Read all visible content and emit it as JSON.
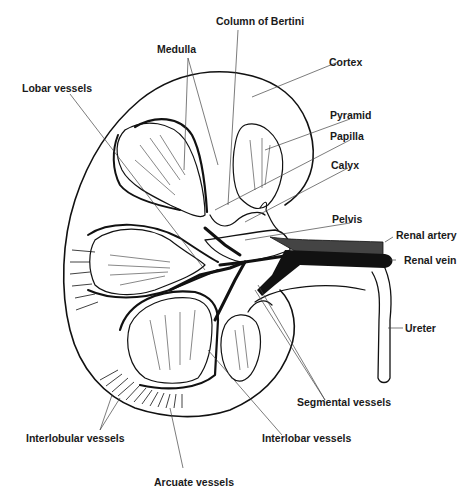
{
  "diagram": {
    "labels": {
      "column_of_bertini": "Column of Bertini",
      "medulla": "Medulla",
      "cortex": "Cortex",
      "lobar_vessels": "Lobar vessels",
      "pyramid": "Pyramid",
      "papilla": "Papilla",
      "calyx": "Calyx",
      "pelvis": "Pelvis",
      "renal_artery": "Renal artery",
      "renal_vein": "Renal vein",
      "ureter": "Ureter",
      "segmental_vessels": "Segmental vessels",
      "interlobular_vessels": "Interlobular vessels",
      "interlobar_vessels": "Interlobar vessels",
      "arcuate_vessels": "Arcuate vessels"
    },
    "colors": {
      "ink": "#111111",
      "background": "#ffffff",
      "leader": "#444444"
    }
  }
}
